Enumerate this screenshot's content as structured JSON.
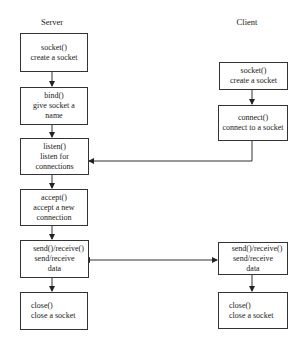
{
  "diagram": {
    "server": {
      "label": "Server",
      "steps": [
        {
          "call": "socket()",
          "desc1": "create a socket",
          "desc2": ""
        },
        {
          "call": "bind()",
          "desc1": "give socket a",
          "desc2": "name"
        },
        {
          "call": "listen()",
          "desc1": "listen for",
          "desc2": "connections"
        },
        {
          "call": "accept()",
          "desc1": "accept a new",
          "desc2": "connection"
        },
        {
          "call": "send()/receive()",
          "desc1": "send/receive",
          "desc2": "data"
        },
        {
          "call": "close()",
          "desc1": "close a socket",
          "desc2": ""
        }
      ]
    },
    "client": {
      "label": "Client",
      "steps": [
        {
          "call": "socket()",
          "desc1": "create a socket",
          "desc2": ""
        },
        {
          "call": "connect()",
          "desc1": "connect to a socket",
          "desc2": ""
        },
        {
          "call": "send()/receive()",
          "desc1": "send/receive",
          "desc2": "data"
        },
        {
          "call": "close()",
          "desc1": "close a socket",
          "desc2": ""
        }
      ]
    },
    "connections": [
      {
        "from": "client.connect()",
        "to": "server.listen()",
        "type": "arrow"
      },
      {
        "from": "server.send()/receive()",
        "to": "client.send()/receive()",
        "type": "bidirectional"
      }
    ]
  }
}
